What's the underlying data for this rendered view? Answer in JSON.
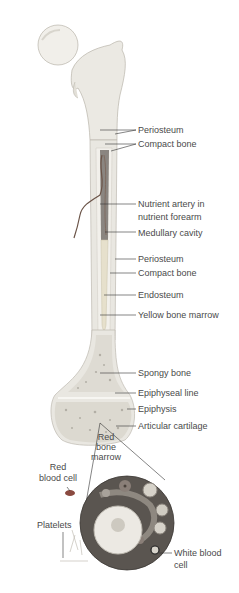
{
  "colors": {
    "bone": "#eceae4",
    "bone_shadow": "#c9c6bd",
    "marrow_yellow": "#e6e0cc",
    "medullary": "#8a8580",
    "artery": "#6b5448",
    "marrow_bg": "#5a5550",
    "red_cell": "#8a4a40",
    "leader_line": "#333333",
    "label_text": "#4a4a4a"
  },
  "labels": {
    "periosteum_top": "Periosteum",
    "compact_bone_top": "Compact bone",
    "nutrient_artery_line1": "Nutrient artery in",
    "nutrient_artery_line2": "nutrient forearm",
    "medullary_cavity": "Medullary cavity",
    "periosteum_mid": "Periosteum",
    "compact_bone_mid": "Compact bone",
    "endosteum": "Endosteum",
    "yellow_bone_marrow": "Yellow bone marrow",
    "spongy_bone": "Spongy bone",
    "epiphyseal_line": "Epiphyseal line",
    "epiphysis": "Epiphysis",
    "articular_cartilage": "Articular cartilage",
    "red_bone_marrow_line1": "Red",
    "red_bone_marrow_line2": "bone",
    "red_bone_marrow_line3": "marrow",
    "red_blood_cell_line1": "Red",
    "red_blood_cell_line2": "blood cell",
    "platelets": "Platelets",
    "white_blood_cell_line1": "White blood",
    "white_blood_cell_line2": "cell"
  }
}
